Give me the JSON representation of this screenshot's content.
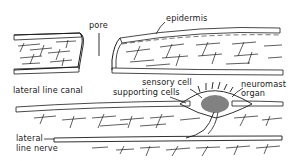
{
  "diagram": {
    "labels": {
      "pore": "pore",
      "epidermis": "epidermis",
      "lateral_line_canal": "lateral line canal",
      "sensory_cell": "sensory cell",
      "supporting_cells": "supporting cells",
      "neuromast_organ_line1": "neuromast",
      "neuromast_organ_line2": "organ",
      "lateral_line_nerve_line1": "lateral",
      "lateral_line_nerve_line2": "line nerve"
    },
    "colors": {
      "ink": "#1a1a1a",
      "background": "#ffffff"
    }
  }
}
